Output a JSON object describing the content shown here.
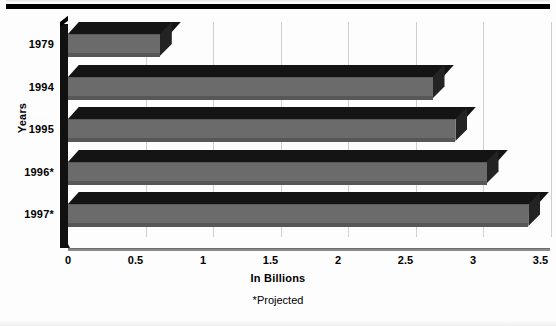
{
  "chart_data": {
    "type": "bar",
    "orientation": "horizontal",
    "title": "",
    "xlabel": "In Billions",
    "ylabel": "Years",
    "categories": [
      "1979",
      "1994",
      "1995",
      "1996*",
      "1997*"
    ],
    "values": [
      0.68,
      2.7,
      2.87,
      3.1,
      3.41
    ],
    "xlim": [
      0,
      3.5
    ],
    "xticks": [
      "0",
      "0.5",
      "1",
      "1.5",
      "2",
      "2.5",
      "3",
      "3.5"
    ],
    "xtick_values": [
      0,
      0.5,
      1,
      1.5,
      2,
      2.5,
      3,
      3.5
    ],
    "grid": true,
    "legend": "none",
    "annotation": "*Projected",
    "style": "3d-bar",
    "colors": {
      "bar_front": "#6b6b6b",
      "bar_top": "#141414",
      "bar_cap": "#232323",
      "axis": "#8a8a8a",
      "grid": "#cfcfcf",
      "text": "#000000"
    }
  },
  "axis": {
    "y_title": "Years",
    "x_title": "In Billions"
  },
  "footnote": {
    "text": "*Projected"
  }
}
